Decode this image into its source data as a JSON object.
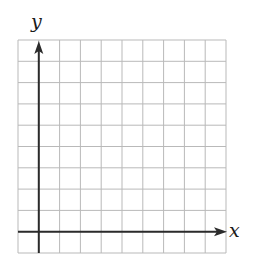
{
  "diagram": {
    "type": "coordinate-grid",
    "x_axis_label": "x",
    "y_axis_label": "y",
    "grid": {
      "columns": 10,
      "rows": 10,
      "left": 18,
      "right": 226,
      "top": 40,
      "bottom": 253,
      "line_color": "#b9b9b9"
    },
    "axes": {
      "y_axis_column": 1,
      "x_axis_row": 9,
      "color": "#2b2b2b",
      "x_arrow": "right",
      "y_arrow": "up"
    }
  }
}
